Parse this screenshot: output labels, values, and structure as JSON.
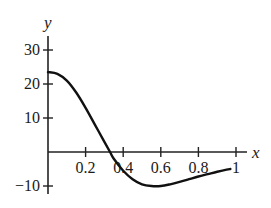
{
  "chart_data": {
    "type": "line",
    "title": "",
    "xlabel": "x",
    "ylabel": "y",
    "xlim": [
      0,
      1
    ],
    "ylim": [
      -10,
      30
    ],
    "grid": false,
    "legend": null,
    "x_ticks": [
      0.2,
      0.4,
      0.6,
      0.8,
      1
    ],
    "x_tick_labels": [
      "0.2",
      "0.4",
      "0.6",
      "0.8",
      "1"
    ],
    "y_ticks": [
      -10,
      10,
      20,
      30
    ],
    "y_tick_labels": [
      "−10",
      "10",
      "20",
      "30"
    ],
    "series": [
      {
        "name": "y(x)",
        "x": [
          0,
          0.05,
          0.1,
          0.15,
          0.2,
          0.25,
          0.3,
          0.33,
          0.35,
          0.4,
          0.45,
          0.5,
          0.55,
          0.6,
          0.65,
          0.7,
          0.75,
          0.8,
          0.85,
          0.9,
          0.95,
          0.97
        ],
        "values": [
          23.5,
          23,
          21,
          17.5,
          13,
          8,
          3,
          0,
          -2,
          -5.5,
          -8,
          -9.5,
          -10,
          -10,
          -9.5,
          -8.8,
          -8,
          -7.2,
          -6.5,
          -5.8,
          -5.2,
          -5
        ]
      }
    ]
  },
  "axes": {
    "x_label": "x",
    "y_label": "y"
  }
}
